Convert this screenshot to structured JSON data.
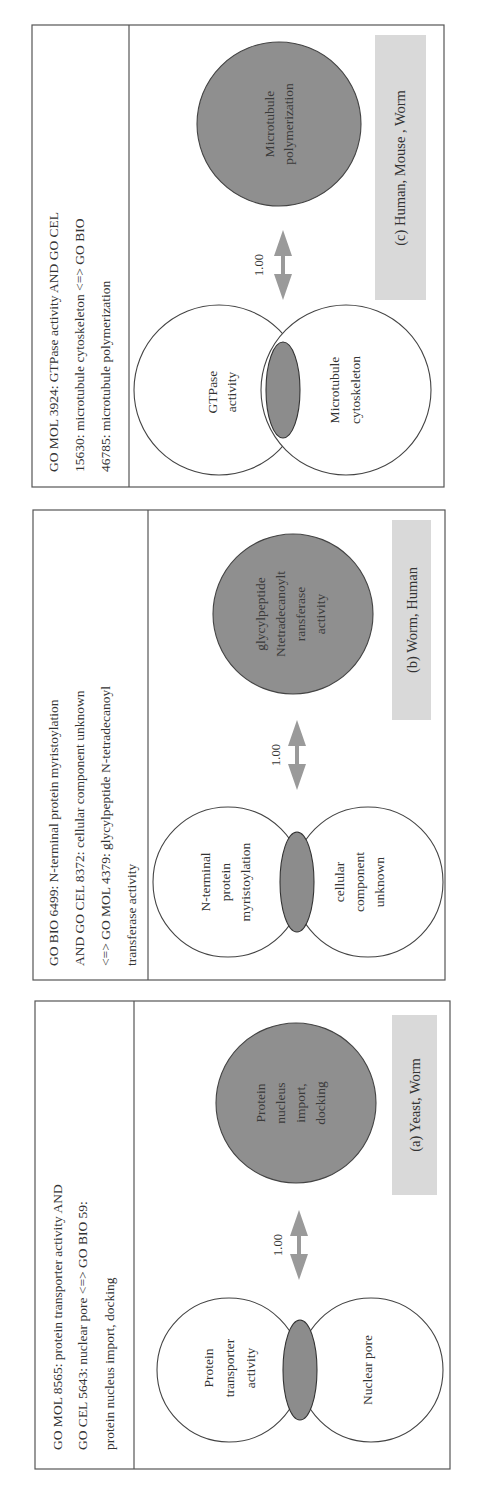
{
  "figure": {
    "orientation": "rotated 90 degrees counter-clockwise",
    "colors": {
      "frame": "#555555",
      "overlap_fill": "#8c8c8c",
      "target_fill": "#8f8f8f",
      "species_box": "#d9d9d9",
      "arrow": "#9a9a9a",
      "text": "#333333"
    },
    "panels": [
      {
        "id": "c",
        "header_lines": [
          "GO MOL 3924: GTPase activity AND GO CEL",
          "15630: microtubule cytoskeleton <=> GO BIO",
          "46785: microtubule polymerization"
        ],
        "venn_left_lines": [
          "GTPase",
          "activity"
        ],
        "venn_right_lines": [
          "Microtubule",
          "cytoskeleton"
        ],
        "target_lines": [
          "Microtubule",
          "polymerization"
        ],
        "score": "1.00",
        "species_label": "(c)  Human, Mouse , Worm"
      },
      {
        "id": "b",
        "header_lines": [
          "GO BIO 6499: N-terminal protein myristoylation",
          "AND GO CEL 8372: cellular component unknown",
          "<=> GO MOL 4379: glycylpeptide N-tetradecanoyl",
          "transferase activity"
        ],
        "venn_left_lines": [
          "N-terminal",
          "protein",
          "myristoylation"
        ],
        "venn_right_lines": [
          "cellular",
          "component",
          "unknown"
        ],
        "target_lines": [
          "glycylpeptide",
          "Ntetradecanoylt",
          "ransferase",
          "activity"
        ],
        "score": "1.00",
        "species_label": "(b) Worm, Human"
      },
      {
        "id": "a",
        "header_lines": [
          "GO MOL 8565: protein transporter activity AND",
          "GO CEL 5643: nuclear pore <=> GO BIO 59:",
          "protein nucleus import, docking"
        ],
        "venn_left_lines": [
          "Protein",
          "transporter",
          "activity"
        ],
        "venn_right_lines": [
          "Nuclear pore"
        ],
        "target_lines": [
          "Protein",
          "nucleus",
          "import,",
          "docking"
        ],
        "score": "1.00",
        "species_label": "(a) Yeast, Worm"
      }
    ]
  }
}
